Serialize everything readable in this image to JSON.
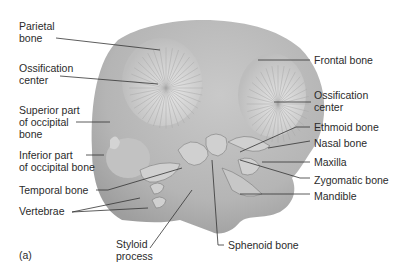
{
  "figure": {
    "panel_label": "(a)",
    "colors": {
      "background": "#ffffff",
      "skull": "#b8b8b8",
      "ossification": "#d9d9d9",
      "leader_line": "#333333",
      "text": "#2b2b2b"
    }
  },
  "labels": {
    "parietal_bone": "Parietal\nbone",
    "ossification_center_left": "Ossification\ncenter",
    "superior_occipital": "Superior part\nof occipital\nbone",
    "inferior_occipital": "Inferior part\nof occipital bone",
    "temporal_bone": "Temporal bone",
    "vertebrae": "Vertebrae",
    "styloid_process": "Styloid\nprocess",
    "sphenoid_bone": "Sphenoid bone",
    "frontal_bone": "Frontal bone",
    "ossification_center_right": "Ossification\ncenter",
    "ethmoid_bone": "Ethmoid bone",
    "nasal_bone": "Nasal bone",
    "maxilla": "Maxilla",
    "zygomatic_bone": "Zygomatic bone",
    "mandible": "Mandible"
  }
}
